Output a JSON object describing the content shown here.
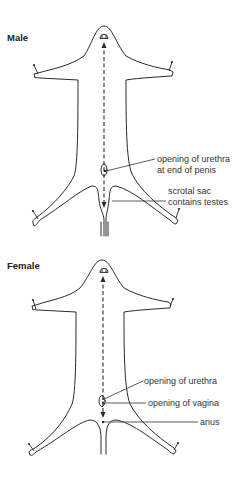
{
  "male": {
    "title": "Male",
    "labels": {
      "urethra_line1": "opening of urethra",
      "urethra_line2": "at end of penis",
      "scrotal_line1": "scrotal sac",
      "scrotal_line2": "contains testes"
    },
    "icon": "dissected-rat-male-outline"
  },
  "female": {
    "title": "Female",
    "labels": {
      "urethra": "opening of urethra",
      "vagina": "opening of vagina",
      "anus": "anus"
    },
    "icon": "dissected-rat-female-outline"
  },
  "colors": {
    "line": "#2a2a2a",
    "text": "#333333",
    "background": "#ffffff"
  }
}
